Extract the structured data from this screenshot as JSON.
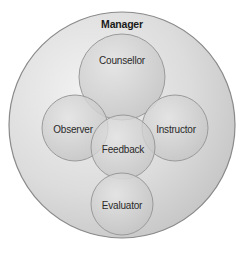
{
  "diagram": {
    "type": "nested-circles",
    "outer": {
      "label": "Manager",
      "cx": 122,
      "cy": 125,
      "r": 113,
      "fill": "#d8d8d8",
      "stroke": "#8a8a8a"
    },
    "roles": [
      {
        "id": "counsellor",
        "label": "Counsellor",
        "cx": 122,
        "cy": 77,
        "r": 43
      },
      {
        "id": "observer",
        "label": "Observer",
        "cx": 75,
        "cy": 128,
        "r": 33
      },
      {
        "id": "instructor",
        "label": "Instructor",
        "cx": 175,
        "cy": 128,
        "r": 33
      },
      {
        "id": "feedback",
        "label": "Feedback",
        "cx": 123,
        "cy": 147,
        "r": 32
      },
      {
        "id": "evaluator",
        "label": "Evaluator",
        "cx": 122,
        "cy": 204,
        "r": 31
      }
    ],
    "colors": {
      "inner_fill": "#cfcfcf",
      "inner_stroke": "#9a9a9a",
      "text": "#2a2a2a"
    }
  }
}
